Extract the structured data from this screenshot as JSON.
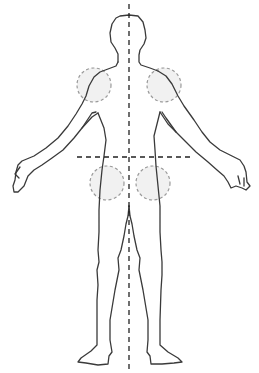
{
  "figure": {
    "colors": {
      "outline": "#3a3a3a",
      "axis_lines": "#222222",
      "region_fill": "#eeeeee",
      "region_stroke": "#9a9a9a",
      "background": "#ffffff"
    },
    "axes": {
      "vertical_midline": {
        "x": 129,
        "y1": 4,
        "y2": 370,
        "style": "dashed"
      },
      "horizontal_line": {
        "y": 157,
        "x1": 77,
        "x2": 190,
        "style": "dashed"
      }
    },
    "regions": [
      {
        "name": "left-shoulder",
        "cx": 94,
        "cy": 85,
        "r": 17
      },
      {
        "name": "right-shoulder",
        "cx": 164,
        "cy": 85,
        "r": 17
      },
      {
        "name": "left-hip",
        "cx": 107,
        "cy": 183,
        "r": 17
      },
      {
        "name": "right-hip",
        "cx": 153,
        "cy": 183,
        "r": 17
      }
    ]
  }
}
